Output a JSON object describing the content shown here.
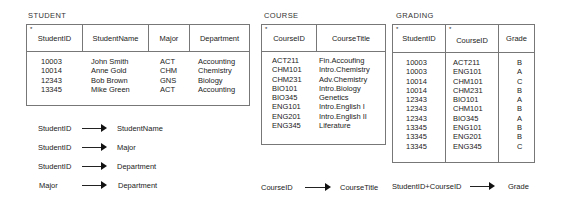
{
  "student": {
    "title": "STUDENT",
    "key_marker": "*",
    "headers": [
      "StudentID",
      "StudentName",
      "Major",
      "Department"
    ],
    "columns": {
      "studentid": "10003\n10014\n12343\n13345",
      "studentname": "John Smith\nAnne Gold\nBob Brown\nMike Green",
      "major": "ACT\nCHM\nGNS\nACT",
      "department": "Accounting\nChemistry\nBiology\nAccounting"
    },
    "rows": [
      {
        "StudentID": "10003",
        "StudentName": "John Smith",
        "Major": "ACT",
        "Department": "Accounting"
      },
      {
        "StudentID": "10014",
        "StudentName": "Anne Gold",
        "Major": "CHM",
        "Department": "Chemistry"
      },
      {
        "StudentID": "12343",
        "StudentName": "Bob Brown",
        "Major": "GNS",
        "Department": "Biology"
      },
      {
        "StudentID": "13345",
        "StudentName": "Mike Green",
        "Major": "ACT",
        "Department": "Accounting"
      }
    ]
  },
  "course": {
    "title": "COURSE",
    "key_marker": "*",
    "headers": [
      "CourseID",
      "CourseTitle"
    ],
    "columns": {
      "courseid": "ACT211\nCHM101\nCHM231\nBIO101\nBIO345\nENG101\nENG201\nENG345",
      "coursetitle": "Fin.Accoufing\nIntro.Chemistry\nAdv.Chemistry\nIntro.Biology\nGenetics\nIntro.English I\nIntro.English II\nLiferature"
    },
    "rows": [
      {
        "CourseID": "ACT211",
        "CourseTitle": "Fin.Accoufing"
      },
      {
        "CourseID": "CHM101",
        "CourseTitle": "Intro.Chemistry"
      },
      {
        "CourseID": "CHM231",
        "CourseTitle": "Adv.Chemistry"
      },
      {
        "CourseID": "BIO101",
        "CourseTitle": "Intro.Biology"
      },
      {
        "CourseID": "BIO345",
        "CourseTitle": "Genetics"
      },
      {
        "CourseID": "ENG101",
        "CourseTitle": "Intro.English I"
      },
      {
        "CourseID": "ENG201",
        "CourseTitle": "Intro.English II"
      },
      {
        "CourseID": "ENG345",
        "CourseTitle": "Liferature"
      }
    ]
  },
  "grading": {
    "title": "GRADING",
    "key_marker": "*",
    "headers": [
      "StudentID",
      "CourseID",
      "Grade"
    ],
    "columns": {
      "studentid": "10003\n10003\n10014\n10014\n12343\n12343\n12343\n13345\n13345\n13345",
      "courseid": "ACT211\nENG101\nCHM101\nCHM231\nBIO101\nCHM101\nBIO345\nENG101\nENG201\nENG345",
      "grade": "B\nA\nC\nB\nA\nB\nA\nB\nB\nC"
    },
    "rows": [
      {
        "StudentID": "10003",
        "CourseID": "ACT211",
        "Grade": "B"
      },
      {
        "StudentID": "10003",
        "CourseID": "ENG101",
        "Grade": "A"
      },
      {
        "StudentID": "10014",
        "CourseID": "CHM101",
        "Grade": "C"
      },
      {
        "StudentID": "10014",
        "CourseID": "CHM231",
        "Grade": "B"
      },
      {
        "StudentID": "12343",
        "CourseID": "BIO101",
        "Grade": "A"
      },
      {
        "StudentID": "12343",
        "CourseID": "CHM101",
        "Grade": "B"
      },
      {
        "StudentID": "12343",
        "CourseID": "BIO345",
        "Grade": "A"
      },
      {
        "StudentID": "13345",
        "CourseID": "ENG101",
        "Grade": "B"
      },
      {
        "StudentID": "13345",
        "CourseID": "ENG201",
        "Grade": "B"
      },
      {
        "StudentID": "13345",
        "CourseID": "ENG345",
        "Grade": "C"
      }
    ]
  },
  "dependencies": [
    {
      "from": "StudentID",
      "to": "StudentName"
    },
    {
      "from": "StudentID",
      "to": "Major"
    },
    {
      "from": "StudentID",
      "to": "Department"
    },
    {
      "from": "Major",
      "to": "Department"
    },
    {
      "from": "CourseID",
      "to": "CourseTitle"
    },
    {
      "from": "StudentID+CourseID",
      "to": "Grade"
    }
  ]
}
